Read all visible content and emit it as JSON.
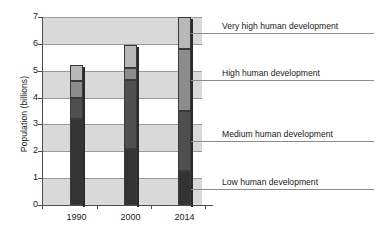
{
  "chart_data": {
    "type": "bar",
    "title": "",
    "xlabel": "",
    "ylabel": "Population (billions)",
    "categories": [
      "1990",
      "2000",
      "2014"
    ],
    "ylim": [
      0,
      7
    ],
    "ytick_labels": [
      "0",
      "1",
      "2",
      "3",
      "4",
      "5",
      "6",
      "7"
    ],
    "grid": true,
    "stacked": true,
    "legend_position": "right-callouts",
    "series": [
      {
        "name": "Low human development",
        "color": "#333333",
        "values": [
          3.2,
          2.1,
          1.25
        ]
      },
      {
        "name": "Medium human development",
        "color": "#4f4f4f",
        "values": [
          0.8,
          2.55,
          2.25
        ]
      },
      {
        "name": "High human development",
        "color": "#8c8c8c",
        "values": [
          0.6,
          0.45,
          2.3
        ]
      },
      {
        "name": "Very high human development",
        "color": "#b8b8b8",
        "values": [
          0.6,
          0.85,
          1.2
        ]
      }
    ],
    "totals": [
      5.2,
      5.95,
      7.0
    ],
    "annotations": [
      {
        "label": "Very high human development",
        "points_to_value": 6.4
      },
      {
        "label": "High human development",
        "points_to_value": 4.65
      },
      {
        "label": "Medium human development",
        "points_to_value": 2.4
      },
      {
        "label": "Low human development",
        "points_to_value": 0.6
      }
    ],
    "background_bands": [
      {
        "from": 0,
        "to": 1
      },
      {
        "from": 2,
        "to": 3
      },
      {
        "from": 4,
        "to": 5
      },
      {
        "from": 6,
        "to": 7
      }
    ]
  }
}
